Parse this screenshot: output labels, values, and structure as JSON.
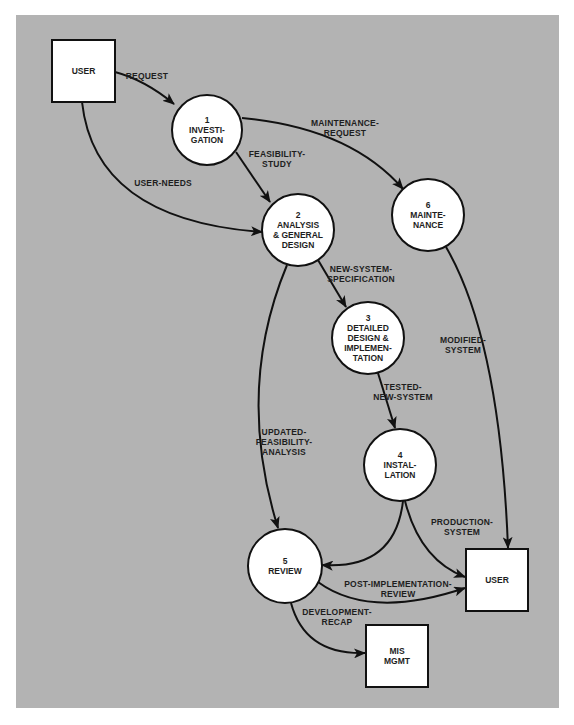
{
  "diagram": {
    "type": "data-flow-diagram",
    "colors": {
      "background": "#b3b3b3",
      "node_fill": "#ffffff",
      "stroke": "#111111",
      "text": "#1e1e1e"
    },
    "entities": [
      {
        "id": "user_top",
        "lines": [
          "USER"
        ]
      },
      {
        "id": "user_bottom",
        "lines": [
          "USER"
        ]
      },
      {
        "id": "mis_mgmt",
        "lines": [
          "MIS",
          "MGMT"
        ]
      }
    ],
    "processes": [
      {
        "id": "p1",
        "lines": [
          "1",
          "INVESTI-",
          "GATION"
        ]
      },
      {
        "id": "p2",
        "lines": [
          "2",
          "ANALYSIS",
          "& GENERAL",
          "DESIGN"
        ]
      },
      {
        "id": "p3",
        "lines": [
          "3",
          "DETAILED",
          "DESIGN &",
          "IMPLEMEN-",
          "TATION"
        ]
      },
      {
        "id": "p4",
        "lines": [
          "4",
          "INSTAL-",
          "LATION"
        ]
      },
      {
        "id": "p5",
        "lines": [
          "5",
          "REVIEW"
        ]
      },
      {
        "id": "p6",
        "lines": [
          "6",
          "MAINTE-",
          "NANCE"
        ]
      }
    ],
    "flows": [
      {
        "id": "request",
        "from": "user_top",
        "to": "p1",
        "lines": [
          "REQUEST"
        ]
      },
      {
        "id": "user_needs",
        "from": "user_top",
        "to": "p2",
        "lines": [
          "USER-NEEDS"
        ]
      },
      {
        "id": "feasibility_study",
        "from": "p1",
        "to": "p2",
        "lines": [
          "FEASIBILITY-",
          "STUDY"
        ]
      },
      {
        "id": "maintenance_request",
        "from": "p1",
        "to": "p6",
        "lines": [
          "MAINTENANCE-",
          "REQUEST"
        ]
      },
      {
        "id": "new_system_spec",
        "from": "p2",
        "to": "p3",
        "lines": [
          "NEW-SYSTEM-",
          "SPECIFICATION"
        ]
      },
      {
        "id": "updated_feasibility",
        "from": "p2",
        "to": "p5",
        "lines": [
          "UPDATED-",
          "FEASIBILITY-",
          "ANALYSIS"
        ]
      },
      {
        "id": "tested_new_system",
        "from": "p3",
        "to": "p4",
        "lines": [
          "TESTED-",
          "NEW-SYSTEM"
        ]
      },
      {
        "id": "modified_system",
        "from": "p6",
        "to": "user_bottom",
        "lines": [
          "MODIFIED-",
          "SYSTEM"
        ]
      },
      {
        "id": "production_system",
        "from": "p4",
        "to": "user_bottom",
        "lines": [
          "PRODUCTION-",
          "SYSTEM"
        ]
      },
      {
        "id": "install_to_review",
        "from": "p4",
        "to": "p5",
        "lines": []
      },
      {
        "id": "post_impl_review",
        "from": "p5",
        "to": "user_bottom",
        "lines": [
          "POST-IMPLEMENTATION-",
          "REVIEW"
        ]
      },
      {
        "id": "development_recap",
        "from": "p5",
        "to": "mis_mgmt",
        "lines": [
          "DEVELOPMENT-",
          "RECAP"
        ]
      }
    ]
  }
}
